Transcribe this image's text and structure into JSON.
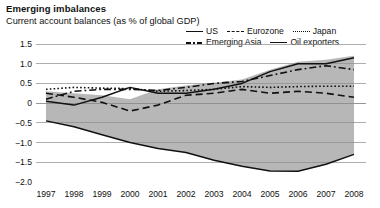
{
  "header": {
    "title": "Emerging imbalances",
    "subtitle": "Current account balances (as % of global GDP)"
  },
  "legend": {
    "rows": [
      [
        {
          "label": "US",
          "style": "solid"
        },
        {
          "label": "Eurozone",
          "style": "dash"
        },
        {
          "label": "Japan",
          "style": "dot"
        }
      ],
      [
        {
          "label": "Emerging Asia",
          "style": "dashdot"
        },
        {
          "label": "Oil exporters",
          "style": "solid"
        }
      ]
    ]
  },
  "axes": {
    "y_ticks": [
      "1.5",
      "1.0",
      "0.5",
      "0",
      "−0.5",
      "−1.0",
      "−1.5",
      "−2.0"
    ],
    "y_values": [
      1.5,
      1.0,
      0.5,
      0,
      -0.5,
      -1.0,
      -1.5,
      -2.0
    ],
    "x_ticks": [
      "1997",
      "1998",
      "1999",
      "2000",
      "2001",
      "2002",
      "2003",
      "2004",
      "2005",
      "2006",
      "2007",
      "2008"
    ]
  },
  "colors": {
    "band_fill": "#b3b3b3",
    "line": "#111111",
    "gridline": "#8c8c8c",
    "background": "#ffffff"
  },
  "chart_data": {
    "type": "line",
    "title": "Emerging imbalances",
    "subtitle": "Current account balances (as % of global GDP)",
    "xlabel": "",
    "ylabel": "% of global GDP",
    "ylim": [
      -2.0,
      1.5
    ],
    "grid": true,
    "legend_position": "top-right",
    "x": [
      1997,
      1998,
      1999,
      2000,
      2001,
      2002,
      2003,
      2004,
      2005,
      2006,
      2007,
      2008
    ],
    "series": [
      {
        "name": "US",
        "style": "solid",
        "values": [
          -0.45,
          -0.6,
          -0.8,
          -1.0,
          -1.15,
          -1.25,
          -1.45,
          -1.6,
          -1.72,
          -1.73,
          -1.55,
          -1.3
        ]
      },
      {
        "name": "Eurozone",
        "style": "dash",
        "values": [
          0.25,
          0.15,
          0.02,
          -0.2,
          -0.05,
          0.2,
          0.25,
          0.35,
          0.25,
          0.3,
          0.25,
          0.15
        ]
      },
      {
        "name": "Japan",
        "style": "dot",
        "values": [
          0.35,
          0.4,
          0.38,
          0.37,
          0.3,
          0.32,
          0.35,
          0.42,
          0.4,
          0.42,
          0.43,
          0.43
        ]
      },
      {
        "name": "Emerging Asia",
        "style": "dashdot",
        "values": [
          0.1,
          0.3,
          0.35,
          0.35,
          0.32,
          0.4,
          0.5,
          0.55,
          0.7,
          0.85,
          0.95,
          0.85
        ]
      },
      {
        "name": "Oil exporters",
        "style": "solid",
        "values": [
          0.05,
          -0.05,
          0.15,
          0.4,
          0.25,
          0.25,
          0.35,
          0.5,
          0.8,
          1.0,
          1.0,
          1.15
        ]
      }
    ],
    "band": {
      "note": "Shaded band spans from the US (lower bound) to the upper envelope of surplus economies",
      "upper": [
        0.3,
        0.25,
        0.2,
        0.1,
        0.35,
        0.45,
        0.52,
        0.6,
        0.85,
        1.05,
        1.1,
        1.2
      ],
      "lower": [
        -0.45,
        -0.6,
        -0.8,
        -1.0,
        -1.15,
        -1.25,
        -1.45,
        -1.6,
        -1.72,
        -1.73,
        -1.55,
        -1.3
      ]
    }
  }
}
